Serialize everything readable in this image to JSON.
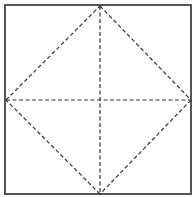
{
  "diagram": {
    "type": "fold-pattern",
    "canvas": {
      "width": 193,
      "height": 197
    },
    "background": "#ffffff",
    "square": {
      "x1": 5,
      "y1": 5,
      "x2": 191,
      "y2": 194,
      "stroke": "#555555",
      "stroke_width": 2
    },
    "dashed_style": {
      "stroke": "#333333",
      "stroke_width": 1.2,
      "dash": "4 2.5"
    },
    "vertices": {
      "top": {
        "x": 100,
        "y": 6
      },
      "right": {
        "x": 191,
        "y": 100
      },
      "bottom": {
        "x": 100,
        "y": 194
      },
      "left": {
        "x": 6,
        "y": 100
      },
      "center": {
        "x": 100,
        "y": 100
      }
    },
    "lines": [
      {
        "name": "diamond-edge-top-right",
        "from": "top",
        "to": "right"
      },
      {
        "name": "diamond-edge-right-bottom",
        "from": "right",
        "to": "bottom"
      },
      {
        "name": "diamond-edge-bottom-left",
        "from": "bottom",
        "to": "left"
      },
      {
        "name": "diamond-edge-left-top",
        "from": "left",
        "to": "top"
      },
      {
        "name": "vertical-center-line",
        "from": "top",
        "to": "bottom"
      },
      {
        "name": "horizontal-center-line",
        "from": "left",
        "to": "right"
      }
    ]
  }
}
